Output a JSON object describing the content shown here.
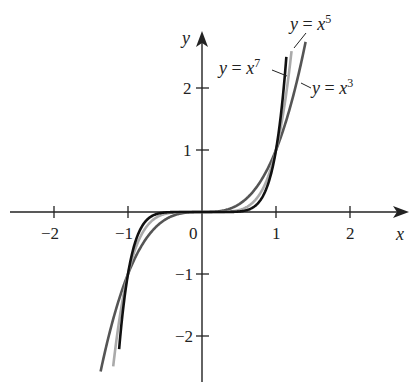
{
  "chart_data": {
    "type": "line",
    "title": "",
    "xlabel": "x",
    "ylabel": "y",
    "xlim": [
      -2.2,
      2.5
    ],
    "ylim": [
      -2.7,
      2.9
    ],
    "grid": false,
    "legend_position": "inline labels",
    "x_ticks": [
      -2,
      -1,
      0,
      1,
      2
    ],
    "x_tick_labels": [
      "−2",
      "−1",
      "0",
      "1",
      "2"
    ],
    "y_ticks": [
      -2,
      -1,
      1,
      2
    ],
    "y_tick_labels": [
      "−2",
      "−1",
      "1",
      "2"
    ],
    "series": [
      {
        "name": "y = x^3",
        "label_base": "y = x",
        "exponent": "3",
        "power": 3,
        "color": "#555555",
        "x_range": [
          -1.37,
          1.4
        ]
      },
      {
        "name": "y = x^5",
        "label_base": "y = x",
        "exponent": "5",
        "power": 5,
        "color": "#aaaaaa",
        "x_range": [
          -1.2,
          1.21
        ]
      },
      {
        "name": "y = x^7",
        "label_base": "y = x",
        "exponent": "7",
        "power": 7,
        "color": "#111111",
        "x_range": [
          -1.12,
          1.14
        ]
      }
    ],
    "intersections": [
      [
        -1,
        -1
      ],
      [
        0,
        0
      ],
      [
        1,
        1
      ]
    ]
  }
}
